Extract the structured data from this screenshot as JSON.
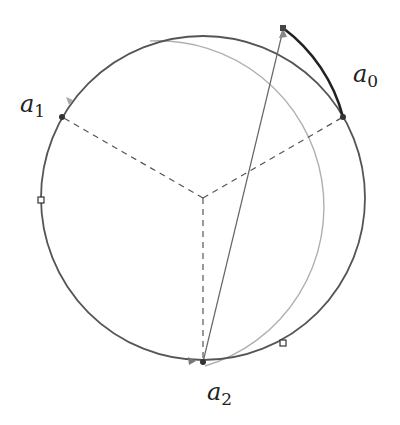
{
  "diagram": {
    "circle": {
      "cx": 203,
      "cy": 198,
      "r": 162,
      "stroke": "#555555"
    },
    "center": {
      "x": 203,
      "y": 198
    },
    "points": [
      {
        "id": "a0",
        "name": "a",
        "sub": "0",
        "x": 343,
        "y": 117,
        "label_x": 353,
        "label_y": 62
      },
      {
        "id": "a1",
        "name": "a",
        "sub": "1",
        "x": 62,
        "y": 117,
        "label_x": 20,
        "label_y": 92
      },
      {
        "id": "a2",
        "name": "a",
        "sub": "2",
        "x": 203,
        "y": 362,
        "label_x": 207,
        "label_y": 380
      }
    ],
    "chord": {
      "from": "a2",
      "to": {
        "x": 283,
        "y": 28
      },
      "stroke": "#666666"
    },
    "squares": [
      {
        "x": 41,
        "y": 200
      },
      {
        "x": 283,
        "y": 343
      }
    ],
    "colors": {
      "dashed": "#555555",
      "outer_arc": "#aaaaaa",
      "highlight_arc": "#222222",
      "arrow": "#999999"
    }
  },
  "labels": {
    "a0": {
      "base": "a",
      "sub": "0"
    },
    "a1": {
      "base": "a",
      "sub": "1"
    },
    "a2": {
      "base": "a",
      "sub": "2"
    }
  }
}
